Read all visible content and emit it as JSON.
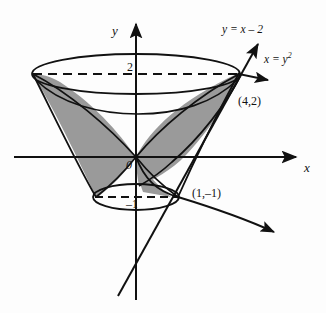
{
  "figure": {
    "kind": "math-diagram",
    "background_color": "#fdfdfd",
    "stroke_color": "#111111",
    "shade_color": "#9a9a9a"
  },
  "axes": {
    "x_label": "x",
    "y_label": "y",
    "origin_label": "0",
    "x_axis_y_px": 157,
    "y_axis_x_px": 136
  },
  "ticks": [
    {
      "name": "tick-2",
      "label": "2",
      "axis": "y",
      "value": 2
    },
    {
      "name": "tick-minus-1",
      "label": "–1",
      "axis": "y",
      "value": -1
    }
  ],
  "curves": [
    {
      "name": "line",
      "label": "y = x – 2",
      "equation_text": "y = x – 2",
      "type": "line"
    },
    {
      "name": "parabola",
      "label": "x = y",
      "exponent": "2",
      "equation_text": "x = y²",
      "type": "parabola"
    }
  ],
  "points": [
    {
      "name": "intersection-upper",
      "label": "(4,2)",
      "x": 4,
      "y": 2
    },
    {
      "name": "intersection-lower",
      "label": "(1,–1)",
      "x": 1,
      "y": -1
    }
  ],
  "regions": [
    {
      "name": "shaded-left-lobe",
      "fill": "#9a9a9a"
    },
    {
      "name": "shaded-right-lobe",
      "fill": "#9a9a9a"
    }
  ],
  "solid": {
    "top_ellipse_level": 2,
    "bottom_ellipse_level": -1,
    "top_dashed_label": "2",
    "bottom_dashed_label": "–1"
  }
}
